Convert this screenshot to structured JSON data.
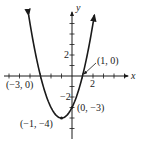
{
  "chart_data": {
    "type": "line",
    "title": "",
    "function": "y = x^2 + 2x - 3",
    "xlabel": "x",
    "ylabel": "y",
    "xlim": [
      -6.5,
      5
    ],
    "ylim": [
      -5.8,
      6
    ],
    "grid": false,
    "x_tick_labels": [
      {
        "value": 2,
        "label": "2"
      }
    ],
    "y_tick_labels": [
      {
        "value": 2,
        "label": "2"
      },
      {
        "value": -2,
        "label": "−2"
      }
    ],
    "points": [
      {
        "x": -3,
        "y": 0,
        "label": "(−3, 0)"
      },
      {
        "x": 1,
        "y": 0,
        "label": "(1, 0)"
      },
      {
        "x": 0,
        "y": -3,
        "label": "(0, −3)"
      },
      {
        "x": -1,
        "y": -4,
        "label": "(−1, −4)"
      }
    ],
    "series": [
      {
        "name": "parabola",
        "x": [
          -4.13,
          -3,
          -2,
          -1,
          0,
          1,
          2.13
        ],
        "values": [
          5.8,
          0,
          -3,
          -4,
          -3,
          0,
          5.8
        ]
      }
    ]
  },
  "labels": {
    "x_axis": "x",
    "y_axis": "y",
    "x_tick_2": "2",
    "y_tick_2": "2",
    "y_tick_neg2": "−2",
    "pt_neg3_0": "(−3, 0)",
    "pt_1_0": "(1, 0)",
    "pt_0_neg3": "(0, −3)",
    "pt_neg1_neg4": "(−1, −4)"
  },
  "colors": {
    "ink": "#1a1a1a",
    "background": "#ffffff"
  }
}
